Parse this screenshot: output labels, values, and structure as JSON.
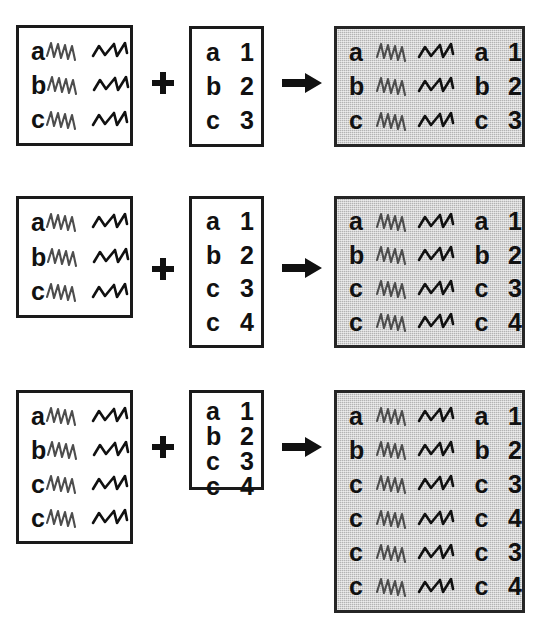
{
  "figure": {
    "background_color": "#ffffff",
    "box_border_color": "#1a1a1a",
    "result_fill_color": "#b3b3b3",
    "operator_color": "#111111"
  },
  "glyphs": {
    "dense_squiggle": "dense-zigzag-icon",
    "sparse_squiggle": "sparse-zigzag-icon",
    "plus": "plus-icon",
    "arrow": "right-arrow-icon"
  },
  "rows": [
    {
      "id": "scenario-1",
      "left_table": {
        "name": "left-table",
        "rows": [
          {
            "letter": "a"
          },
          {
            "letter": "b"
          },
          {
            "letter": "c"
          }
        ]
      },
      "right_table": {
        "name": "right-table",
        "rows": [
          {
            "letter": "a",
            "number": "1"
          },
          {
            "letter": "b",
            "number": "2"
          },
          {
            "letter": "c",
            "number": "3"
          }
        ]
      },
      "result_table": {
        "name": "result-table",
        "rows": [
          {
            "letter": "a",
            "letter2": "a",
            "number": "1"
          },
          {
            "letter": "b",
            "letter2": "b",
            "number": "2"
          },
          {
            "letter": "c",
            "letter2": "c",
            "number": "3"
          }
        ]
      }
    },
    {
      "id": "scenario-2",
      "left_table": {
        "name": "left-table",
        "rows": [
          {
            "letter": "a"
          },
          {
            "letter": "b"
          },
          {
            "letter": "c"
          }
        ]
      },
      "right_table": {
        "name": "right-table",
        "rows": [
          {
            "letter": "a",
            "number": "1"
          },
          {
            "letter": "b",
            "number": "2"
          },
          {
            "letter": "c",
            "number": "3"
          },
          {
            "letter": "c",
            "number": "4"
          }
        ]
      },
      "result_table": {
        "name": "result-table",
        "rows": [
          {
            "letter": "a",
            "letter2": "a",
            "number": "1"
          },
          {
            "letter": "b",
            "letter2": "b",
            "number": "2"
          },
          {
            "letter": "c",
            "letter2": "c",
            "number": "3"
          },
          {
            "letter": "c",
            "letter2": "c",
            "number": "4"
          }
        ]
      }
    },
    {
      "id": "scenario-3",
      "left_table": {
        "name": "left-table",
        "rows": [
          {
            "letter": "a"
          },
          {
            "letter": "b"
          },
          {
            "letter": "c"
          },
          {
            "letter": "c"
          }
        ]
      },
      "right_table": {
        "name": "right-table",
        "rows": [
          {
            "letter": "a",
            "number": "1"
          },
          {
            "letter": "b",
            "number": "2"
          },
          {
            "letter": "c",
            "number": "3"
          },
          {
            "letter": "c",
            "number": "4"
          }
        ]
      },
      "result_table": {
        "name": "result-table",
        "rows": [
          {
            "letter": "a",
            "letter2": "a",
            "number": "1"
          },
          {
            "letter": "b",
            "letter2": "b",
            "number": "2"
          },
          {
            "letter": "c",
            "letter2": "c",
            "number": "3"
          },
          {
            "letter": "c",
            "letter2": "c",
            "number": "4"
          },
          {
            "letter": "c",
            "letter2": "c",
            "number": "3"
          },
          {
            "letter": "c",
            "letter2": "c",
            "number": "4"
          }
        ]
      }
    }
  ],
  "geometry": {
    "rows": [
      {
        "left": {
          "x": 16,
          "y": 25,
          "w": 117,
          "h": 121
        },
        "plus": {
          "x": 151,
          "y": 71
        },
        "right": {
          "x": 189,
          "y": 26,
          "w": 75,
          "h": 121
        },
        "arrow": {
          "x": 282,
          "y": 73
        },
        "result": {
          "x": 334,
          "y": 26,
          "w": 191,
          "h": 121
        }
      },
      {
        "left": {
          "x": 16,
          "y": 196,
          "w": 117,
          "h": 122
        },
        "plus": {
          "x": 151,
          "y": 257
        },
        "right": {
          "x": 189,
          "y": 196,
          "w": 75,
          "h": 152
        },
        "arrow": {
          "x": 282,
          "y": 258
        },
        "result": {
          "x": 334,
          "y": 196,
          "w": 191,
          "h": 152
        }
      },
      {
        "left": {
          "x": 16,
          "y": 390,
          "w": 117,
          "h": 154
        },
        "plus": {
          "x": 151,
          "y": 435
        },
        "right": {
          "x": 189,
          "y": 390,
          "w": 75,
          "h": 100
        },
        "arrow": {
          "x": 282,
          "y": 437
        },
        "result": {
          "x": 334,
          "y": 390,
          "w": 191,
          "h": 223
        }
      }
    ]
  }
}
